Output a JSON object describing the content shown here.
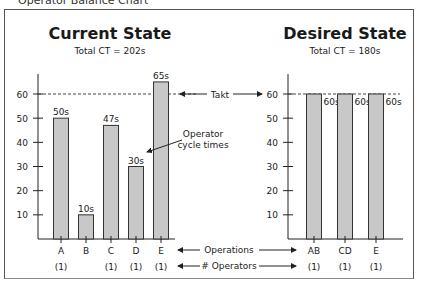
{
  "caption": "Operator Balance Chart",
  "current": {
    "title": "Current State",
    "subtitle": "Total CT = 202s"
  },
  "desired": {
    "title": "Desired State",
    "subtitle": "Total CT = 180s"
  },
  "annotations": {
    "takt": "Takt",
    "operator_cycle_times_line1": "Operator",
    "operator_cycle_times_line2": "cycle times",
    "operations": "Operations",
    "num_operators": "# Operators"
  },
  "chart_data": [
    {
      "type": "bar",
      "title": "Current State",
      "subtitle": "Total CT = 202s",
      "categories": [
        "A",
        "B",
        "C",
        "D",
        "E"
      ],
      "values": [
        50,
        10,
        47,
        30,
        65
      ],
      "data_labels": [
        "50s",
        "10s",
        "47s",
        "30s",
        "65s"
      ],
      "operators": [
        "(1)",
        "",
        "(1)",
        "(1)",
        "(1)"
      ],
      "yticks": [
        10,
        20,
        30,
        40,
        50,
        60
      ],
      "ylim": [
        0,
        68
      ],
      "takt_line": 60,
      "xlabel": "Operations",
      "ylabel": "",
      "bar_color": "#c8c8c8"
    },
    {
      "type": "bar",
      "title": "Desired State",
      "subtitle": "Total CT = 180s",
      "categories": [
        "AB",
        "CD",
        "E"
      ],
      "values": [
        60,
        60,
        60
      ],
      "data_labels": [
        "60s",
        "60s",
        "60s"
      ],
      "operators": [
        "(1)",
        "(1)",
        "(1)"
      ],
      "yticks": [
        10,
        20,
        30,
        40,
        50,
        60
      ],
      "ylim": [
        0,
        68
      ],
      "takt_line": 60,
      "xlabel": "Operations",
      "ylabel": "",
      "bar_color": "#c8c8c8"
    }
  ]
}
